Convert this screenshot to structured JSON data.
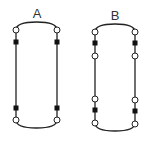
{
  "figures": [
    {
      "label": "A",
      "shape": "stadium",
      "node_sequence_left": [
        "open-circle",
        "filled-square",
        "filled-square",
        "open-circle"
      ],
      "node_sequence_right": [
        "open-circle",
        "filled-square",
        "filled-square",
        "open-circle"
      ]
    },
    {
      "label": "B",
      "shape": "stadium",
      "node_sequence_left": [
        "open-circle",
        "filled-square",
        "open-circle",
        "open-circle",
        "filled-square",
        "open-circle"
      ],
      "node_sequence_right": [
        "open-circle",
        "filled-square",
        "open-circle",
        "open-circle",
        "filled-square",
        "open-circle"
      ]
    }
  ],
  "colors": {
    "stroke": "#222222",
    "square_fill": "#111111",
    "circle_fill": "#ffffff"
  }
}
